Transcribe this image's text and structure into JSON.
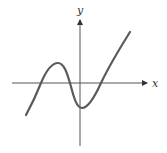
{
  "figure": {
    "axes": {
      "x_label": "x",
      "y_label": "y",
      "color": "#555555"
    },
    "curve": {
      "color": "#5a5a5a",
      "points": [
        [
          26,
          115
        ],
        [
          41,
          83
        ],
        [
          58,
          63
        ],
        [
          70,
          83
        ],
        [
          81,
          108
        ],
        [
          101,
          83
        ],
        [
          130,
          32
        ]
      ]
    },
    "features": {
      "x_intercepts": 3,
      "local_max": "left of y-axis, above x-axis",
      "local_min": "near y-axis, below x-axis"
    }
  }
}
